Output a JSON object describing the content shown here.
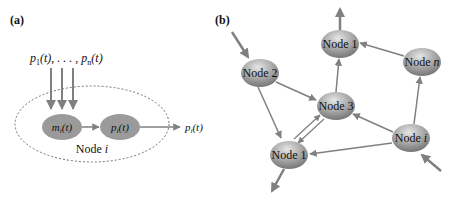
{
  "panel_a": {
    "label": "(a)",
    "inputs_label_first": "p",
    "inputs_label_first_sub": "1",
    "inputs_label_mid": "(t), . . . , ",
    "inputs_label_last": "p",
    "inputs_label_last_sub": "n",
    "inputs_label_tail": "(t)",
    "inner_node_m": {
      "base": "m",
      "sub": "i",
      "tail": "(t)"
    },
    "inner_node_p": {
      "base": "p",
      "sub": "i",
      "tail": "(t)"
    },
    "output_label": {
      "base": "p",
      "sub": "i",
      "tail": "(t)"
    },
    "container_label_prefix": "Node ",
    "container_label_var": "i"
  },
  "panel_b": {
    "label": "(b)",
    "nodes": [
      {
        "id": "node2",
        "prefix": "Node ",
        "var": "2",
        "var_italic": false
      },
      {
        "id": "node1_top",
        "prefix": "Node ",
        "var": "1",
        "var_italic": false
      },
      {
        "id": "noden",
        "prefix": "Node ",
        "var": "n",
        "var_italic": true
      },
      {
        "id": "node3",
        "prefix": "Node ",
        "var": "3",
        "var_italic": false
      },
      {
        "id": "nodei",
        "prefix": "Node ",
        "var": "i",
        "var_italic": true
      },
      {
        "id": "node1_bottom",
        "prefix": "Node ",
        "var": "1",
        "var_italic": false
      }
    ],
    "edges": [
      {
        "from": "external",
        "to": "node2"
      },
      {
        "from": "node2",
        "to": "node3"
      },
      {
        "from": "node2",
        "to": "node1_bottom"
      },
      {
        "from": "node3",
        "to": "node1_top"
      },
      {
        "from": "node1_top",
        "to": "external"
      },
      {
        "from": "noden",
        "to": "node1_top"
      },
      {
        "from": "nodei",
        "to": "noden"
      },
      {
        "from": "nodei",
        "to": "node3"
      },
      {
        "from": "nodei",
        "to": "node1_bottom"
      },
      {
        "from": "external",
        "to": "nodei"
      },
      {
        "from": "node3",
        "to": "node1_bottom"
      },
      {
        "from": "node1_bottom",
        "to": "node3"
      },
      {
        "from": "node1_bottom",
        "to": "external"
      }
    ]
  },
  "colors": {
    "arrow": "#808080",
    "node_fill_light": "#c8c8c8",
    "node_fill_dark": "#7a7a7a",
    "inner_node_fill": "#9a9a9a",
    "dashed_border": "#707070"
  }
}
